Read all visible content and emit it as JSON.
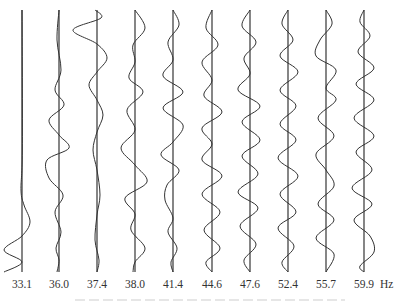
{
  "chart_data": {
    "type": "line",
    "title": "",
    "xlabel": "Frequency",
    "unit": "Hz",
    "layout": {
      "top_y": 10,
      "bottom_y": 272,
      "axis_color": "#222222",
      "curve_color": "#333333"
    },
    "modes": [
      {
        "freq": "33.1",
        "axis_x": 22,
        "points": [
          [
            10,
            0
          ],
          [
            150,
            0.3
          ],
          [
            190,
            -1
          ],
          [
            205,
            2
          ],
          [
            222,
            8
          ],
          [
            236,
            0
          ],
          [
            250,
            -18
          ],
          [
            262,
            0
          ],
          [
            272,
            -18
          ]
        ]
      },
      {
        "freq": "36.0",
        "axis_x": 59,
        "points": [
          [
            10,
            0
          ],
          [
            40,
            -2
          ],
          [
            70,
            2
          ],
          [
            90,
            -4
          ],
          [
            105,
            5
          ],
          [
            120,
            -10
          ],
          [
            135,
            0
          ],
          [
            148,
            10
          ],
          [
            160,
            -12
          ],
          [
            178,
            -10
          ],
          [
            195,
            4
          ],
          [
            212,
            -4
          ],
          [
            232,
            2
          ],
          [
            248,
            -3
          ],
          [
            260,
            0
          ],
          [
            272,
            -2
          ]
        ]
      },
      {
        "freq": "37.4",
        "axis_x": 97,
        "points": [
          [
            10,
            -2
          ],
          [
            18,
            4
          ],
          [
            30,
            -24
          ],
          [
            44,
            0
          ],
          [
            58,
            10
          ],
          [
            72,
            0
          ],
          [
            85,
            -8
          ],
          [
            100,
            0
          ],
          [
            115,
            6
          ],
          [
            132,
            0
          ],
          [
            150,
            -4
          ],
          [
            170,
            0
          ],
          [
            195,
            3
          ],
          [
            215,
            0
          ],
          [
            240,
            -2
          ],
          [
            260,
            2
          ],
          [
            272,
            0
          ]
        ]
      },
      {
        "freq": "38.0",
        "axis_x": 135,
        "points": [
          [
            10,
            0
          ],
          [
            28,
            10
          ],
          [
            45,
            -2
          ],
          [
            62,
            0
          ],
          [
            78,
            -6
          ],
          [
            92,
            8
          ],
          [
            110,
            -8
          ],
          [
            130,
            0
          ],
          [
            148,
            -14
          ],
          [
            165,
            0
          ],
          [
            182,
            12
          ],
          [
            198,
            -10
          ],
          [
            214,
            0
          ],
          [
            230,
            -4
          ],
          [
            248,
            10
          ],
          [
            262,
            0
          ],
          [
            272,
            -2
          ]
        ]
      },
      {
        "freq": "41.4",
        "axis_x": 173,
        "points": [
          [
            10,
            0
          ],
          [
            25,
            6
          ],
          [
            42,
            -5
          ],
          [
            60,
            0
          ],
          [
            76,
            -10
          ],
          [
            92,
            10
          ],
          [
            108,
            -10
          ],
          [
            125,
            10
          ],
          [
            142,
            0
          ],
          [
            155,
            -12
          ],
          [
            170,
            6
          ],
          [
            185,
            -6
          ],
          [
            200,
            -8
          ],
          [
            218,
            0
          ],
          [
            232,
            -5
          ],
          [
            248,
            4
          ],
          [
            262,
            -2
          ],
          [
            272,
            0
          ]
        ]
      },
      {
        "freq": "44.6",
        "axis_x": 212,
        "points": [
          [
            10,
            0
          ],
          [
            28,
            -6
          ],
          [
            45,
            6
          ],
          [
            62,
            -10
          ],
          [
            80,
            0
          ],
          [
            96,
            -8
          ],
          [
            112,
            10
          ],
          [
            128,
            -10
          ],
          [
            144,
            0
          ],
          [
            160,
            -10
          ],
          [
            176,
            10
          ],
          [
            194,
            -10
          ],
          [
            212,
            8
          ],
          [
            230,
            -8
          ],
          [
            248,
            8
          ],
          [
            262,
            -6
          ],
          [
            272,
            0
          ]
        ]
      },
      {
        "freq": "47.6",
        "axis_x": 250,
        "points": [
          [
            10,
            0
          ],
          [
            26,
            -8
          ],
          [
            42,
            6
          ],
          [
            58,
            -6
          ],
          [
            74,
            0
          ],
          [
            90,
            -12
          ],
          [
            106,
            10
          ],
          [
            122,
            -8
          ],
          [
            140,
            10
          ],
          [
            156,
            -8
          ],
          [
            174,
            8
          ],
          [
            192,
            -12
          ],
          [
            208,
            8
          ],
          [
            226,
            -10
          ],
          [
            244,
            6
          ],
          [
            260,
            -6
          ],
          [
            272,
            0
          ]
        ]
      },
      {
        "freq": "52.4",
        "axis_x": 288,
        "points": [
          [
            10,
            0
          ],
          [
            24,
            -6
          ],
          [
            40,
            5
          ],
          [
            56,
            -8
          ],
          [
            72,
            10
          ],
          [
            90,
            -8
          ],
          [
            106,
            8
          ],
          [
            124,
            -8
          ],
          [
            140,
            8
          ],
          [
            158,
            -10
          ],
          [
            176,
            10
          ],
          [
            194,
            -8
          ],
          [
            212,
            8
          ],
          [
            228,
            -10
          ],
          [
            246,
            6
          ],
          [
            262,
            -6
          ],
          [
            272,
            0
          ]
        ]
      },
      {
        "freq": "55.7",
        "axis_x": 326,
        "points": [
          [
            10,
            0
          ],
          [
            24,
            6
          ],
          [
            40,
            -6
          ],
          [
            56,
            -10
          ],
          [
            70,
            10
          ],
          [
            88,
            0
          ],
          [
            100,
            10
          ],
          [
            118,
            -8
          ],
          [
            136,
            8
          ],
          [
            154,
            -10
          ],
          [
            170,
            0
          ],
          [
            186,
            8
          ],
          [
            204,
            -8
          ],
          [
            220,
            8
          ],
          [
            238,
            -10
          ],
          [
            254,
            8
          ],
          [
            272,
            0
          ]
        ]
      },
      {
        "freq": "59.9",
        "axis_x": 364,
        "points": [
          [
            10,
            0
          ],
          [
            22,
            -4
          ],
          [
            36,
            6
          ],
          [
            52,
            -6
          ],
          [
            68,
            10
          ],
          [
            84,
            -8
          ],
          [
            100,
            10
          ],
          [
            118,
            -10
          ],
          [
            136,
            10
          ],
          [
            152,
            -8
          ],
          [
            170,
            8
          ],
          [
            188,
            -12
          ],
          [
            204,
            8
          ],
          [
            220,
            -10
          ],
          [
            236,
            6
          ],
          [
            252,
            10
          ],
          [
            266,
            -4
          ],
          [
            272,
            0
          ]
        ]
      }
    ],
    "categories": [
      "33.1",
      "36.0",
      "37.4",
      "38.0",
      "41.4",
      "44.6",
      "47.6",
      "52.4",
      "55.7",
      "59.9"
    ],
    "legend": []
  },
  "labels": {
    "unit": "Hz"
  }
}
